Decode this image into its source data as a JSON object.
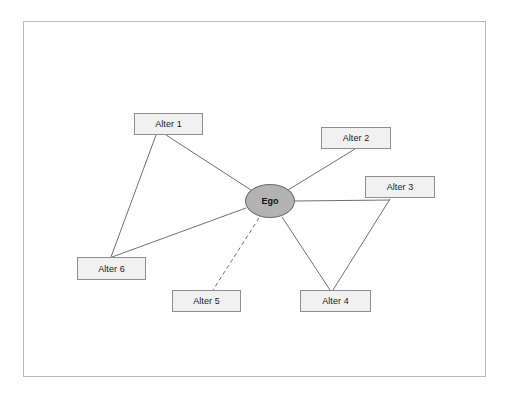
{
  "diagram": {
    "background_color": "#ffffff",
    "frame": {
      "border_color": "#b9b9b9",
      "x": 23,
      "y": 21,
      "width": 463,
      "height": 356
    },
    "ego": {
      "label": "Ego",
      "shape": "ellipse",
      "fill_color": "#b3b3b3",
      "border_color": "#6e6e6e",
      "cx": 270,
      "cy": 201,
      "rx": 25,
      "ry": 17
    },
    "alters": [
      {
        "id": "alter-1",
        "label": "Alter 1",
        "x": 134,
        "y": 113,
        "width": 69,
        "height": 22
      },
      {
        "id": "alter-2",
        "label": "Alter 2",
        "x": 321,
        "y": 127,
        "width": 70,
        "height": 22
      },
      {
        "id": "alter-3",
        "label": "Alter 3",
        "x": 365,
        "y": 176,
        "width": 70,
        "height": 22
      },
      {
        "id": "alter-4",
        "label": "Alter 4",
        "x": 300,
        "y": 290,
        "width": 71,
        "height": 22
      },
      {
        "id": "alter-5",
        "label": "Alter 5",
        "x": 172,
        "y": 290,
        "width": 69,
        "height": 22
      },
      {
        "id": "alter-6",
        "label": "Alter 6",
        "x": 77,
        "y": 257,
        "width": 69,
        "height": 23
      }
    ],
    "node_style": {
      "fill_color": "#f1f1f1",
      "border_color": "#8f8f8f"
    },
    "edges": [
      {
        "id": "edge-ego-alter1",
        "from": "ego",
        "to": "alter-1",
        "style": "solid",
        "x1": 251,
        "y1": 190,
        "x2": 166,
        "y2": 135
      },
      {
        "id": "edge-ego-alter2",
        "from": "ego",
        "to": "alter-2",
        "style": "solid",
        "x1": 288,
        "y1": 190,
        "x2": 355,
        "y2": 149
      },
      {
        "id": "edge-ego-alter3",
        "from": "ego",
        "to": "alter-3",
        "style": "solid",
        "x1": 295,
        "y1": 201,
        "x2": 390,
        "y2": 200
      },
      {
        "id": "edge-ego-alter4",
        "from": "ego",
        "to": "alter-4",
        "style": "solid",
        "x1": 282,
        "y1": 217,
        "x2": 330,
        "y2": 290
      },
      {
        "id": "edge-ego-alter5",
        "from": "ego",
        "to": "alter-5",
        "style": "dashed",
        "x1": 259,
        "y1": 218,
        "x2": 213,
        "y2": 290
      },
      {
        "id": "edge-ego-alter6",
        "from": "ego",
        "to": "alter-6",
        "style": "solid",
        "x1": 246,
        "y1": 208,
        "x2": 112,
        "y2": 257
      },
      {
        "id": "edge-alter1-alter6",
        "from": "alter-1",
        "to": "alter-6",
        "style": "solid",
        "x1": 156,
        "y1": 135,
        "x2": 111,
        "y2": 257
      },
      {
        "id": "edge-alter3-alter4",
        "from": "alter-3",
        "to": "alter-4",
        "style": "solid",
        "x1": 390,
        "y1": 199,
        "x2": 333,
        "y2": 290
      }
    ],
    "edge_style": {
      "color": "#6f6f6f",
      "width": 1,
      "dash_pattern": "4,3"
    }
  }
}
